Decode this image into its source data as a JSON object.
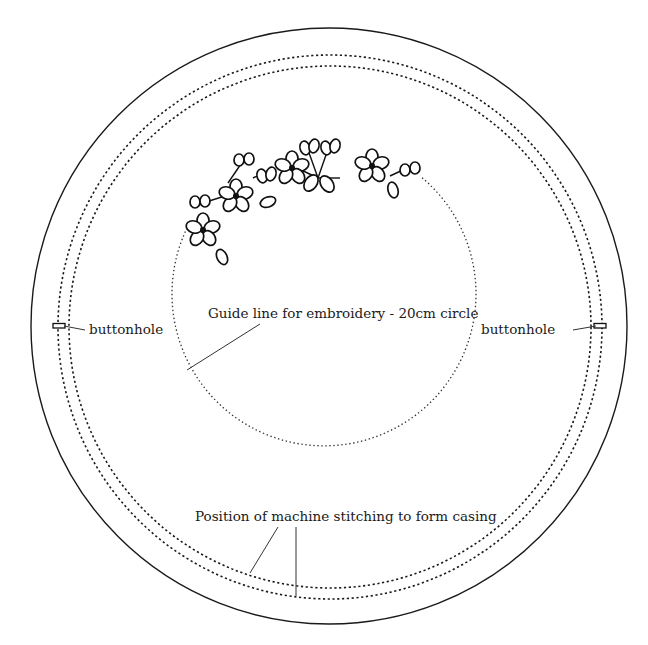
{
  "diagram": {
    "labels": {
      "guide_line": "Guide line for embroidery - 20cm circle",
      "buttonhole_left": "buttonhole",
      "buttonhole_right": "buttonhole",
      "casing": "Position of machine stitching to form casing"
    },
    "shapes": {
      "outer_circle": {
        "cx": 329,
        "cy": 326,
        "r": 298,
        "style": "solid"
      },
      "casing_stitch_outer": {
        "cx": 330,
        "cy": 327,
        "r": 272,
        "style": "dashed"
      },
      "casing_stitch_inner": {
        "cx": 330,
        "cy": 327,
        "r": 261,
        "style": "dashed"
      },
      "embroidery_guide_circle": {
        "cx": 330,
        "cy": 313,
        "r": 152,
        "style": "dotted",
        "diameter_label": "20cm"
      }
    },
    "embroidery_motif": {
      "type": "floral garland",
      "flowers": 5,
      "leaf_sprigs": 6,
      "position": "upper-left arc of guide circle"
    },
    "colors": {
      "ink": "#1a1a1a",
      "background": "#ffffff"
    }
  }
}
